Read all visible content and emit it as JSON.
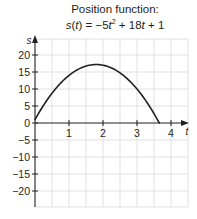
{
  "chart_data": {
    "type": "line",
    "title_line1": "Position function:",
    "title_line2": {
      "lhs_func": "s",
      "lhs_var": "t",
      "equals": "=",
      "term1": "−5",
      "term1_var": "t",
      "term1_exp": "2",
      "op1": "+",
      "term2": "18",
      "term2_var": "t",
      "op2": "+",
      "term3": "1"
    },
    "function": {
      "a": -5,
      "b": 18,
      "c": 1
    },
    "domain": [
      0,
      3.654
    ],
    "xlabel": "t",
    "ylabel": "s",
    "xlim": [
      0,
      4.5
    ],
    "ylim": [
      -24.7,
      24.7
    ],
    "xticks": [
      1,
      2,
      3,
      4
    ],
    "xtick_labels": [
      "1",
      "2",
      "3",
      "4"
    ],
    "yticks": [
      20,
      15,
      10,
      5,
      0,
      -5,
      -10,
      -15,
      -20
    ],
    "ytick_labels": [
      "20",
      "15",
      "10",
      "5",
      "0",
      "−5",
      "−10",
      "−15",
      "−20"
    ],
    "x_grid_step": 0.5,
    "y_grid_step": 5,
    "grid": true,
    "colors": {
      "curve": "#231f20",
      "axis": "#231f20",
      "grid": "#d9d9d9",
      "text": "#231f20"
    }
  }
}
